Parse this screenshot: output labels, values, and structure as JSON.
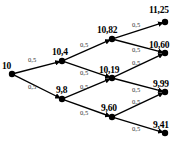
{
  "figure": {
    "type": "binomial-lattice-tree",
    "background_color": "#ffffff",
    "line_color": "#000000",
    "node_color": "#000000",
    "steps": 4
  },
  "nodes": [
    {
      "id": "n0",
      "label": "10",
      "x": 12,
      "y": 74,
      "lx": 2,
      "ly": 62
    },
    {
      "id": "n1u",
      "label": "10,4",
      "x": 62,
      "y": 61,
      "lx": 52,
      "ly": 48
    },
    {
      "id": "n1d",
      "label": "9,8",
      "x": 62,
      "y": 99,
      "lx": 56,
      "ly": 86
    },
    {
      "id": "n2u",
      "label": "10,82",
      "x": 112,
      "y": 39,
      "lx": 97,
      "ly": 26
    },
    {
      "id": "n2m",
      "label": "10,19",
      "x": 112,
      "y": 78,
      "lx": 99,
      "ly": 66
    },
    {
      "id": "n2d",
      "label": "9,60",
      "x": 112,
      "y": 117,
      "lx": 101,
      "ly": 104
    },
    {
      "id": "n3u",
      "label": "11,25",
      "x": 165,
      "y": 22,
      "lx": 149,
      "ly": 6
    },
    {
      "id": "n3um",
      "label": "10,60",
      "x": 165,
      "y": 53,
      "lx": 149,
      "ly": 41
    },
    {
      "id": "n3dm",
      "label": "9,99",
      "x": 165,
      "y": 92,
      "lx": 153,
      "ly": 80
    },
    {
      "id": "n3d",
      "label": "9,41",
      "x": 165,
      "y": 133,
      "lx": 153,
      "ly": 121
    }
  ],
  "edges": [
    {
      "from": "n0",
      "to": "n1u",
      "probability": "0,5",
      "lx": 28,
      "ly": 57
    },
    {
      "from": "n0",
      "to": "n1d",
      "probability": "0,5",
      "lx": 28,
      "ly": 84
    },
    {
      "from": "n1u",
      "to": "n2u",
      "probability": "0,5",
      "lx": 80,
      "ly": 42
    },
    {
      "from": "n1u",
      "to": "n2m",
      "probability": "0,5",
      "lx": 80,
      "ly": 70
    },
    {
      "from": "n1d",
      "to": "n2m",
      "probability": "0,5",
      "lx": 80,
      "ly": 84
    },
    {
      "from": "n1d",
      "to": "n2d",
      "probability": "0,5",
      "lx": 80,
      "ly": 110
    },
    {
      "from": "n2u",
      "to": "n3u",
      "probability": "0,5",
      "lx": 132,
      "ly": 22
    },
    {
      "from": "n2u",
      "to": "n3um",
      "probability": "0,5",
      "lx": 132,
      "ly": 47
    },
    {
      "from": "n2m",
      "to": "n3um",
      "probability": "0,5",
      "lx": 132,
      "ly": 60
    },
    {
      "from": "n2m",
      "to": "n3dm",
      "probability": "0,5",
      "lx": 132,
      "ly": 87
    },
    {
      "from": "n2d",
      "to": "n3dm",
      "probability": "0,5",
      "lx": 132,
      "ly": 99
    },
    {
      "from": "n2d",
      "to": "n3d",
      "probability": "0,5",
      "lx": 132,
      "ly": 126
    }
  ],
  "chart_data": {
    "type": "diagram",
    "title": "",
    "levels": [
      {
        "step": 0,
        "values": [
          "10"
        ]
      },
      {
        "step": 1,
        "values": [
          "10,4",
          "9,8"
        ]
      },
      {
        "step": 2,
        "values": [
          "10,82",
          "10,19",
          "9,60"
        ]
      },
      {
        "step": 3,
        "values": [
          "11,25",
          "10,60",
          "9,99",
          "9,41"
        ]
      }
    ],
    "branch_probability": "0,5"
  }
}
